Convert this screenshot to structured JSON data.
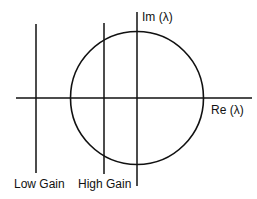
{
  "diagram": {
    "type": "root-locus-sketch",
    "axes": {
      "real_label": "Re (λ)",
      "imag_label": "Im (λ)"
    },
    "circle": {
      "label": "unit circle"
    },
    "lines": [
      {
        "label": "Low Gain"
      },
      {
        "label": "High Gain"
      }
    ],
    "stroke_color": "#111111"
  }
}
